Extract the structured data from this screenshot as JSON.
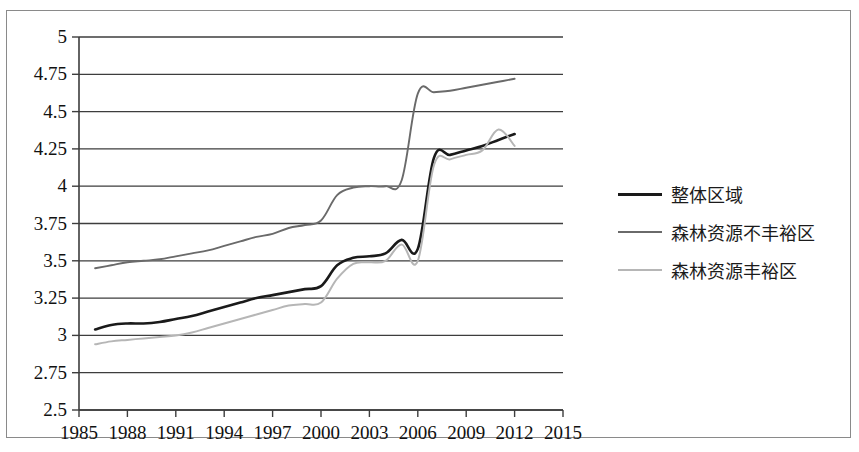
{
  "chart_data": {
    "type": "line",
    "title": "",
    "xlabel": "",
    "ylabel": "",
    "xlim": [
      1985,
      2015
    ],
    "ylim": [
      2.5,
      5
    ],
    "ytick_step": 0.25,
    "grid": true,
    "legend_position": "right",
    "xticks": [
      "1985",
      "1988",
      "1991",
      "1994",
      "1997",
      "2000",
      "2003",
      "2006",
      "2009",
      "2012",
      "2015"
    ],
    "yticks": [
      "5",
      "4.75",
      "4.5",
      "4.25",
      "4",
      "3.75",
      "3.5",
      "3.25",
      "3",
      "2.75",
      "2.5"
    ],
    "x": [
      1986,
      1987,
      1988,
      1989,
      1990,
      1991,
      1992,
      1993,
      1994,
      1995,
      1996,
      1997,
      1998,
      1999,
      2000,
      2001,
      2002,
      2003,
      2004,
      2005,
      2006,
      2007,
      2008,
      2009,
      2010,
      2011,
      2012
    ],
    "series": [
      {
        "name": "整体区域",
        "color": "#1a1a1a",
        "width": 2.6,
        "values": [
          3.04,
          3.07,
          3.08,
          3.08,
          3.09,
          3.11,
          3.13,
          3.16,
          3.19,
          3.22,
          3.25,
          3.27,
          3.29,
          3.31,
          3.33,
          3.47,
          3.52,
          3.53,
          3.55,
          3.64,
          3.58,
          4.19,
          4.21,
          4.24,
          4.27,
          4.31,
          4.35
        ]
      },
      {
        "name": "森林资源不丰裕区",
        "color": "#6a6a6a",
        "width": 1.9,
        "values": [
          3.45,
          3.47,
          3.49,
          3.5,
          3.51,
          3.53,
          3.55,
          3.57,
          3.6,
          3.63,
          3.66,
          3.68,
          3.72,
          3.74,
          3.77,
          3.94,
          3.99,
          4.0,
          4.0,
          4.04,
          4.62,
          4.63,
          4.64,
          4.66,
          4.68,
          4.7,
          4.72
        ]
      },
      {
        "name": "森林资源丰裕区",
        "color": "#b6b6b6",
        "width": 2.0,
        "values": [
          2.94,
          2.96,
          2.97,
          2.98,
          2.99,
          3.0,
          3.02,
          3.05,
          3.08,
          3.11,
          3.14,
          3.17,
          3.2,
          3.21,
          3.22,
          3.38,
          3.48,
          3.49,
          3.5,
          3.61,
          3.5,
          4.14,
          4.18,
          4.21,
          4.24,
          4.38,
          4.27
        ]
      }
    ]
  },
  "legend": {
    "items": [
      {
        "label": "整体区域"
      },
      {
        "label": "森林资源不丰裕区"
      },
      {
        "label": "森林资源丰裕区"
      }
    ]
  },
  "axes": {
    "x_labels": [
      "1985",
      "1988",
      "1991",
      "1994",
      "1997",
      "2000",
      "2003",
      "2006",
      "2009",
      "2012",
      "2015"
    ],
    "y_labels": [
      "5",
      "4.75",
      "4.5",
      "4.25",
      "4",
      "3.75",
      "3.5",
      "3.25",
      "3",
      "2.75",
      "2.5"
    ]
  }
}
